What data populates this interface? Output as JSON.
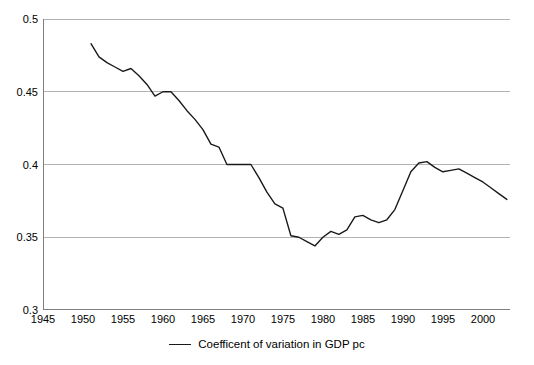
{
  "chart_data": {
    "type": "line",
    "title": "",
    "subtitle": "",
    "xlabel": "",
    "ylabel": "",
    "xlim": [
      1945,
      2003.4
    ],
    "ylim": [
      0.3,
      0.5
    ],
    "grid": true,
    "grid_axis": "y",
    "legend_position": "bottom-center",
    "x_ticks": [
      1945,
      1950,
      1955,
      1960,
      1965,
      1970,
      1975,
      1980,
      1985,
      1990,
      1995,
      2000
    ],
    "x_tick_labels": [
      "1945",
      "1950",
      "1955",
      "1960",
      "1965",
      "1970",
      "1975",
      "1980",
      "1985",
      "1990",
      "1995",
      "2000"
    ],
    "y_ticks": [
      0.3,
      0.35,
      0.4,
      0.45,
      0.5
    ],
    "y_tick_labels": [
      "0.3",
      "0.35",
      "0.4",
      "0.45",
      "0.5"
    ],
    "series": [
      {
        "name": "Coefficent of variation in GDP pc",
        "color": "#1a1a1a",
        "x": [
          1951,
          1952,
          1953,
          1954,
          1955,
          1956,
          1957,
          1958,
          1959,
          1960,
          1961,
          1962,
          1963,
          1964,
          1965,
          1966,
          1967,
          1968,
          1969,
          1970,
          1971,
          1972,
          1973,
          1974,
          1975,
          1976,
          1977,
          1978,
          1979,
          1980,
          1981,
          1982,
          1983,
          1984,
          1985,
          1986,
          1987,
          1988,
          1989,
          1990,
          1991,
          1992,
          1993,
          1994,
          1995,
          1996,
          1997,
          1998,
          1999,
          2000,
          2001,
          2002,
          2003
        ],
        "values": [
          0.483,
          0.474,
          0.47,
          0.467,
          0.464,
          0.466,
          0.461,
          0.455,
          0.447,
          0.45,
          0.45,
          0.444,
          0.437,
          0.431,
          0.424,
          0.414,
          0.412,
          0.4,
          0.4,
          0.4,
          0.4,
          0.391,
          0.381,
          0.373,
          0.37,
          0.351,
          0.35,
          0.347,
          0.344,
          0.35,
          0.354,
          0.352,
          0.355,
          0.364,
          0.365,
          0.362,
          0.36,
          0.362,
          0.369,
          0.382,
          0.395,
          0.401,
          0.402,
          0.398,
          0.395,
          0.396,
          0.397,
          0.394,
          0.391,
          0.388,
          0.384,
          0.38,
          0.376
        ]
      }
    ],
    "legend": [
      {
        "label": "Coefficent of variation in GDP pc",
        "color": "#1a1a1a"
      }
    ],
    "colors": {
      "series_line": "#1a1a1a",
      "gridline": "#b3b3b3",
      "axis": "#808080",
      "background": "#ffffff",
      "text": "#000000"
    }
  }
}
